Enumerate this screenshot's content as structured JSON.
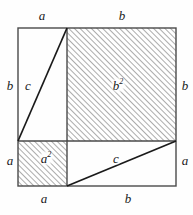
{
  "figure": {
    "background_color": "#fefefe",
    "line_color": "#1a1a1a",
    "hatch_color": "#7a7a7a",
    "outer_square": {
      "x": 18,
      "y": 28,
      "width": 158,
      "height": 158
    },
    "split": {
      "vertical_x": 67,
      "horizontal_y": 141
    },
    "labels": {
      "top_a": "a",
      "top_b": "b",
      "left_b": "b",
      "left_a": "a",
      "right_b": "b",
      "right_a": "a",
      "bottom_a": "a",
      "bottom_b": "b",
      "upper_c": "c",
      "lower_c": "c",
      "b_square_base": "b",
      "b_square_exp": "2",
      "a_square_base": "a",
      "a_square_exp": "2"
    },
    "label_positions": {
      "top_a": {
        "x": 42,
        "y": 15
      },
      "top_b": {
        "x": 122,
        "y": 15
      },
      "left_b": {
        "x": 10,
        "y": 85
      },
      "left_a": {
        "x": 10,
        "y": 160
      },
      "right_b": {
        "x": 185,
        "y": 85
      },
      "right_a": {
        "x": 185,
        "y": 160
      },
      "bottom_a": {
        "x": 44,
        "y": 198
      },
      "bottom_b": {
        "x": 128,
        "y": 198
      },
      "upper_c": {
        "x": 28,
        "y": 85
      },
      "lower_c": {
        "x": 116,
        "y": 158
      },
      "b_square": {
        "x": 118,
        "y": 85
      },
      "a_square": {
        "x": 46,
        "y": 158
      }
    },
    "regions": {
      "b_square_hatched": {
        "x": 67,
        "y": 28,
        "width": 109,
        "height": 113
      },
      "a_square_hatched": {
        "x": 18,
        "y": 141,
        "width": 49,
        "height": 45
      },
      "upper_left_triangle": "vertices (18,28) (67,28) (18,141)",
      "lower_right_triangle": "vertices (67,186) (176,186) (176,141)"
    }
  }
}
